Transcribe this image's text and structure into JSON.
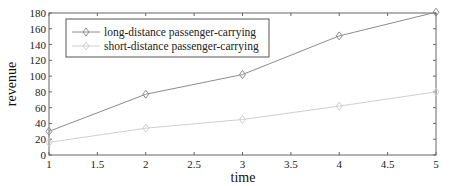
{
  "chart_data": {
    "type": "line",
    "title": "",
    "xlabel": "time",
    "ylabel": "revenue",
    "x": [
      1,
      2,
      3,
      4,
      5
    ],
    "xlim": [
      1,
      5
    ],
    "ylim": [
      0,
      180
    ],
    "xticks": [
      "1",
      "1.5",
      "2",
      "2.5",
      "3",
      "3.5",
      "4",
      "4.5",
      "5"
    ],
    "yticks": [
      "0",
      "20",
      "40",
      "60",
      "80",
      "100",
      "120",
      "140",
      "160",
      "180"
    ],
    "grid": false,
    "legend_position": "upper left",
    "series": [
      {
        "name": "long-distance passenger-carrying",
        "values": [
          30,
          77,
          102,
          151,
          181
        ],
        "color": "#8c8c8c",
        "marker": "diamond"
      },
      {
        "name": "short-distance passenger-carrying",
        "values": [
          16,
          34,
          45,
          62,
          80
        ],
        "color": "#cfcfcf",
        "marker": "diamond"
      }
    ]
  }
}
